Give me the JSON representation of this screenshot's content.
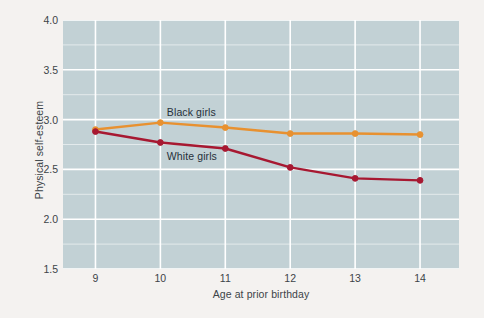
{
  "figure": {
    "background_color": "#f4f2f0",
    "plot_background_color": "#c2d1d5",
    "gridline_color": "#ffffff"
  },
  "chart_data": {
    "type": "line",
    "title": "",
    "xlabel": "Age at prior birthday",
    "ylabel": "Physical self-esteem",
    "x": [
      9,
      10,
      11,
      12,
      13,
      14
    ],
    "xtick_labels": [
      "9",
      "10",
      "11",
      "12",
      "13",
      "14"
    ],
    "xlim": [
      8.5,
      14.6
    ],
    "ylim": [
      1.5,
      4.0
    ],
    "ytick_labels": [
      "1.5",
      "2.0",
      "2.5",
      "3.0",
      "3.5",
      "4.0"
    ],
    "ytick_values": [
      1.5,
      2.0,
      2.5,
      3.0,
      3.5,
      4.0
    ],
    "minor_ytick_values": [
      1.75,
      2.25,
      2.75,
      3.25,
      3.75
    ],
    "grid": true,
    "legend_position": "inline-labels",
    "series": [
      {
        "name": "Black girls",
        "color": "#e89130",
        "marker": "circle",
        "values": [
          2.9,
          2.97,
          2.92,
          2.86,
          2.86,
          2.85
        ]
      },
      {
        "name": "White girls",
        "color": "#a71831",
        "marker": "circle",
        "values": [
          2.88,
          2.77,
          2.71,
          2.52,
          2.41,
          2.39
        ]
      }
    ],
    "annotations": [
      {
        "text": "Black girls",
        "x": 10.1,
        "y": 3.07
      },
      {
        "text": "White girls",
        "x": 10.1,
        "y": 2.62
      }
    ]
  }
}
